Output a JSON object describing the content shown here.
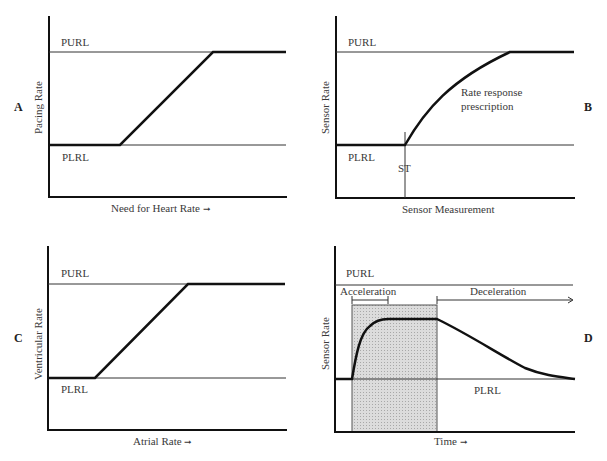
{
  "panels": {
    "A": {
      "letter": "A",
      "ylabel": "Pacing Rate",
      "xlabel": "Need for Heart Rate",
      "arrow": "→",
      "purl": "PURL",
      "plrl": "PLRL"
    },
    "B": {
      "letter": "B",
      "ylabel": "Sensor Rate",
      "xlabel": "Sensor Measurement",
      "purl": "PURL",
      "plrl": "PLRL",
      "st": "ST",
      "annotation_line1": "Rate response",
      "annotation_line2": "prescription"
    },
    "C": {
      "letter": "C",
      "ylabel": "Ventricular Rate",
      "xlabel": "Atrial Rate",
      "arrow": "→",
      "purl": "PURL",
      "plrl": "PLRL"
    },
    "D": {
      "letter": "D",
      "ylabel": "Sensor Rate",
      "xlabel": "Time",
      "arrow": "→",
      "purl": "PURL",
      "plrl": "PLRL",
      "acceleration": "Acceleration",
      "deceleration": "Deceleration"
    }
  },
  "colors": {
    "axis": "#111111",
    "limit_line": "#333333",
    "curve": "#111111",
    "shade": "#d6d6d6"
  }
}
